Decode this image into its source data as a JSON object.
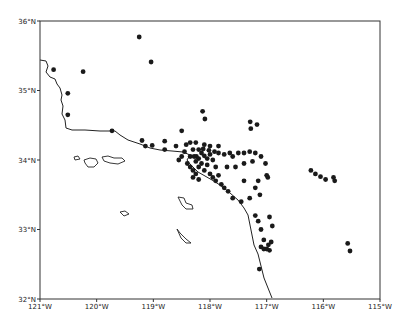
{
  "map": {
    "title": "",
    "frame": {
      "x0": 40,
      "y0": 21,
      "x1": 380,
      "y1": 299
    },
    "lon_range": [
      -121,
      -115
    ],
    "lat_range": [
      32,
      36
    ],
    "x_ticks": [
      {
        "label": "121°W",
        "lon": -121
      },
      {
        "label": "120°W",
        "lon": -120
      },
      {
        "label": "119°W",
        "lon": -119
      },
      {
        "label": "118°W",
        "lon": -118
      },
      {
        "label": "117°W",
        "lon": -117
      },
      {
        "label": "116°W",
        "lon": -116
      },
      {
        "label": "115°W",
        "lon": -115
      }
    ],
    "y_ticks": [
      {
        "label": "36°N",
        "lat": 36
      },
      {
        "label": "35°N",
        "lat": 35
      },
      {
        "label": "34°N",
        "lat": 34
      },
      {
        "label": "33°N",
        "lat": 33
      },
      {
        "label": "32°N",
        "lat": 32
      }
    ],
    "colors": {
      "frame": "#333333",
      "coast": "#222222",
      "point": "#1a1a1a"
    },
    "coastline": [
      [
        40,
        60
      ],
      [
        46,
        61
      ],
      [
        48,
        66
      ],
      [
        46,
        72
      ],
      [
        50,
        77
      ],
      [
        55,
        79
      ],
      [
        57,
        84
      ],
      [
        60,
        88
      ],
      [
        62,
        95
      ],
      [
        61,
        100
      ],
      [
        63,
        106
      ],
      [
        62,
        114
      ],
      [
        65,
        120
      ],
      [
        66,
        128
      ],
      [
        72,
        130
      ],
      [
        85,
        130
      ],
      [
        100,
        131
      ],
      [
        115,
        131
      ],
      [
        120,
        135
      ],
      [
        128,
        140
      ],
      [
        140,
        144
      ],
      [
        150,
        148
      ],
      [
        160,
        150
      ],
      [
        172,
        151
      ],
      [
        183,
        152
      ],
      [
        190,
        155
      ],
      [
        187,
        160
      ],
      [
        190,
        164
      ],
      [
        193,
        167
      ],
      [
        198,
        172
      ],
      [
        205,
        176
      ],
      [
        212,
        180
      ],
      [
        220,
        185
      ],
      [
        230,
        193
      ],
      [
        238,
        200
      ],
      [
        244,
        208
      ],
      [
        248,
        215
      ],
      [
        250,
        225
      ],
      [
        252,
        235
      ],
      [
        254,
        245
      ],
      [
        258,
        254
      ],
      [
        260,
        262
      ],
      [
        262,
        270
      ],
      [
        264,
        278
      ],
      [
        268,
        288
      ],
      [
        272,
        298
      ]
    ],
    "islands": [
      [
        [
          74,
          157
        ],
        [
          78,
          156
        ],
        [
          80,
          159
        ],
        [
          75,
          160
        ]
      ],
      [
        [
          84,
          160
        ],
        [
          90,
          158
        ],
        [
          96,
          159
        ],
        [
          98,
          163
        ],
        [
          94,
          167
        ],
        [
          88,
          167
        ],
        [
          85,
          163
        ]
      ],
      [
        [
          102,
          157
        ],
        [
          108,
          156
        ],
        [
          114,
          158
        ],
        [
          122,
          158
        ],
        [
          125,
          161
        ],
        [
          118,
          164
        ],
        [
          110,
          163
        ],
        [
          104,
          161
        ]
      ],
      [
        [
          178,
          197
        ],
        [
          184,
          198
        ],
        [
          186,
          203
        ],
        [
          192,
          205
        ],
        [
          193,
          209
        ],
        [
          186,
          209
        ],
        [
          182,
          205
        ],
        [
          180,
          201
        ]
      ],
      [
        [
          120,
          212
        ],
        [
          125,
          211
        ],
        [
          129,
          214
        ],
        [
          124,
          216
        ]
      ],
      [
        [
          177,
          229
        ],
        [
          180,
          233
        ],
        [
          186,
          239
        ],
        [
          191,
          243
        ],
        [
          186,
          243
        ],
        [
          181,
          238
        ]
      ]
    ],
    "points": [
      {
        "lon": -120.24,
        "lat": 35.27
      },
      {
        "lon": -119.25,
        "lat": 35.77
      },
      {
        "lon": -119.04,
        "lat": 35.41
      },
      {
        "lon": -120.51,
        "lat": 34.96
      },
      {
        "lon": -120.51,
        "lat": 34.65
      },
      {
        "lon": -120.76,
        "lat": 35.3
      },
      {
        "lon": -119.73,
        "lat": 34.42
      },
      {
        "lon": -119.2,
        "lat": 34.28
      },
      {
        "lon": -119.14,
        "lat": 34.2
      },
      {
        "lon": -119.02,
        "lat": 34.21
      },
      {
        "lon": -118.8,
        "lat": 34.27
      },
      {
        "lon": -118.8,
        "lat": 34.15
      },
      {
        "lon": -118.5,
        "lat": 34.42
      },
      {
        "lon": -118.13,
        "lat": 34.7
      },
      {
        "lon": -118.09,
        "lat": 34.59
      },
      {
        "lon": -117.29,
        "lat": 34.55
      },
      {
        "lon": -117.17,
        "lat": 34.51
      },
      {
        "lon": -117.28,
        "lat": 34.45
      },
      {
        "lon": -116.22,
        "lat": 33.85
      },
      {
        "lon": -116.14,
        "lat": 33.8
      },
      {
        "lon": -116.05,
        "lat": 33.76
      },
      {
        "lon": -115.96,
        "lat": 33.72
      },
      {
        "lon": -115.82,
        "lat": 33.75
      },
      {
        "lon": -115.8,
        "lat": 33.7
      },
      {
        "lon": -115.57,
        "lat": 32.8
      },
      {
        "lon": -115.53,
        "lat": 32.69
      },
      {
        "lon": -118.35,
        "lat": 34.05
      },
      {
        "lon": -118.28,
        "lat": 34.05
      },
      {
        "lon": -118.24,
        "lat": 34.05
      },
      {
        "lon": -118.2,
        "lat": 34.02
      },
      {
        "lon": -118.15,
        "lat": 34.1
      },
      {
        "lon": -118.1,
        "lat": 34.06
      },
      {
        "lon": -118.05,
        "lat": 34.02
      },
      {
        "lon": -118.0,
        "lat": 34.08
      },
      {
        "lon": -117.95,
        "lat": 34.0
      },
      {
        "lon": -118.3,
        "lat": 34.15
      },
      {
        "lon": -118.2,
        "lat": 34.15
      },
      {
        "lon": -118.12,
        "lat": 34.16
      },
      {
        "lon": -118.02,
        "lat": 34.14
      },
      {
        "lon": -117.92,
        "lat": 34.12
      },
      {
        "lon": -117.85,
        "lat": 34.1
      },
      {
        "lon": -117.75,
        "lat": 34.08
      },
      {
        "lon": -117.65,
        "lat": 34.1
      },
      {
        "lon": -117.6,
        "lat": 34.05
      },
      {
        "lon": -117.5,
        "lat": 34.1
      },
      {
        "lon": -117.4,
        "lat": 34.1
      },
      {
        "lon": -117.3,
        "lat": 34.12
      },
      {
        "lon": -117.2,
        "lat": 34.1
      },
      {
        "lon": -117.1,
        "lat": 34.05
      },
      {
        "lon": -117.25,
        "lat": 33.98
      },
      {
        "lon": -117.4,
        "lat": 33.95
      },
      {
        "lon": -117.55,
        "lat": 33.9
      },
      {
        "lon": -117.7,
        "lat": 33.9
      },
      {
        "lon": -117.02,
        "lat": 33.95
      },
      {
        "lon": -116.98,
        "lat": 33.75
      },
      {
        "lon": -117.0,
        "lat": 33.78
      },
      {
        "lon": -117.15,
        "lat": 33.7
      },
      {
        "lon": -117.2,
        "lat": 33.6
      },
      {
        "lon": -117.12,
        "lat": 33.5
      },
      {
        "lon": -117.3,
        "lat": 33.45
      },
      {
        "lon": -117.4,
        "lat": 33.7
      },
      {
        "lon": -118.4,
        "lat": 33.95
      },
      {
        "lon": -118.35,
        "lat": 33.9
      },
      {
        "lon": -118.3,
        "lat": 33.85
      },
      {
        "lon": -118.25,
        "lat": 33.8
      },
      {
        "lon": -118.2,
        "lat": 33.9
      },
      {
        "lon": -118.1,
        "lat": 33.85
      },
      {
        "lon": -118.0,
        "lat": 33.8
      },
      {
        "lon": -117.95,
        "lat": 33.75
      },
      {
        "lon": -117.9,
        "lat": 33.7
      },
      {
        "lon": -117.85,
        "lat": 33.78
      },
      {
        "lon": -117.8,
        "lat": 33.65
      },
      {
        "lon": -117.75,
        "lat": 33.6
      },
      {
        "lon": -117.68,
        "lat": 33.55
      },
      {
        "lon": -117.6,
        "lat": 33.45
      },
      {
        "lon": -117.45,
        "lat": 33.4
      },
      {
        "lon": -118.5,
        "lat": 34.05
      },
      {
        "lon": -118.55,
        "lat": 34.0
      },
      {
        "lon": -118.45,
        "lat": 34.12
      },
      {
        "lon": -118.6,
        "lat": 34.2
      },
      {
        "lon": -118.42,
        "lat": 34.22
      },
      {
        "lon": -118.35,
        "lat": 34.25
      },
      {
        "lon": -118.25,
        "lat": 34.25
      },
      {
        "lon": -118.1,
        "lat": 34.22
      },
      {
        "lon": -118.0,
        "lat": 34.2
      },
      {
        "lon": -117.85,
        "lat": 34.2
      },
      {
        "lon": -118.15,
        "lat": 33.95
      },
      {
        "lon": -118.05,
        "lat": 33.93
      },
      {
        "lon": -117.9,
        "lat": 33.9
      },
      {
        "lon": -118.25,
        "lat": 33.98
      },
      {
        "lon": -118.3,
        "lat": 33.75
      },
      {
        "lon": -118.2,
        "lat": 33.72
      },
      {
        "lon": -117.2,
        "lat": 33.2
      },
      {
        "lon": -117.15,
        "lat": 33.12
      },
      {
        "lon": -117.1,
        "lat": 33.0
      },
      {
        "lon": -116.95,
        "lat": 33.18
      },
      {
        "lon": -116.9,
        "lat": 33.05
      },
      {
        "lon": -117.05,
        "lat": 32.85
      },
      {
        "lon": -117.1,
        "lat": 32.75
      },
      {
        "lon": -117.05,
        "lat": 32.72
      },
      {
        "lon": -117.0,
        "lat": 32.72
      },
      {
        "lon": -116.95,
        "lat": 32.7
      },
      {
        "lon": -116.97,
        "lat": 32.78
      },
      {
        "lon": -116.92,
        "lat": 32.82
      },
      {
        "lon": -117.13,
        "lat": 32.43
      }
    ]
  }
}
